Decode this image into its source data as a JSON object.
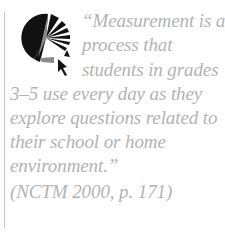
{
  "colors": {
    "text": "#b3b3b3",
    "rule": "#c8c8c8",
    "logo_dark": "#111111",
    "logo_grey": "#8a8a8a"
  },
  "logo": {
    "icon": "measurement-logo-icon",
    "description": "circle with radiating wedges and arrow cursor"
  },
  "quote": {
    "lines": [
      "“Measurement is a",
      "process that",
      "students in grades",
      "3–5 use every day as they",
      "explore questions related to",
      "their school or home",
      "environment.”",
      "(NCTM 2000, p. 171)"
    ],
    "text": "“Measurement is a process that students in grades 3–5 use every day as they explore questions related to their school or home environment.”",
    "citation": "(NCTM 2000, p. 171)"
  }
}
